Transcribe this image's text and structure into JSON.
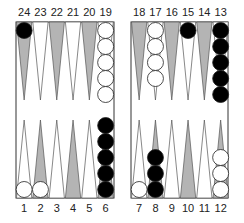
{
  "game": "backgammon",
  "colors": {
    "board_bg": "#ffffff",
    "border": "#333333",
    "triangle_dark": "#b4b4b4",
    "triangle_light": "#ffffff",
    "triangle_stroke": "#555555",
    "checker_black": "#000000",
    "checker_white": "#ffffff"
  },
  "top_labels": [
    "24",
    "23",
    "22",
    "21",
    "20",
    "19",
    "18",
    "17",
    "16",
    "15",
    "14",
    "13"
  ],
  "bottom_labels": [
    "1",
    "2",
    "3",
    "4",
    "5",
    "6",
    "7",
    "8",
    "9",
    "10",
    "11",
    "12"
  ],
  "points": [
    {
      "point": 1,
      "color": "white",
      "count": 1
    },
    {
      "point": 2,
      "color": "white",
      "count": 1
    },
    {
      "point": 3,
      "color": null,
      "count": 0
    },
    {
      "point": 4,
      "color": null,
      "count": 0
    },
    {
      "point": 5,
      "color": null,
      "count": 0
    },
    {
      "point": 6,
      "color": "black",
      "count": 5
    },
    {
      "point": 7,
      "color": "white",
      "count": 1
    },
    {
      "point": 8,
      "color": "black",
      "count": 3
    },
    {
      "point": 9,
      "color": null,
      "count": 0
    },
    {
      "point": 10,
      "color": null,
      "count": 0
    },
    {
      "point": 11,
      "color": null,
      "count": 0
    },
    {
      "point": 12,
      "color": "white",
      "count": 3
    },
    {
      "point": 13,
      "color": "black",
      "count": 5
    },
    {
      "point": 14,
      "color": null,
      "count": 0
    },
    {
      "point": 15,
      "color": "black",
      "count": 1
    },
    {
      "point": 16,
      "color": null,
      "count": 0
    },
    {
      "point": 17,
      "color": "white",
      "count": 4
    },
    {
      "point": 18,
      "color": null,
      "count": 0
    },
    {
      "point": 19,
      "color": "white",
      "count": 5
    },
    {
      "point": 20,
      "color": null,
      "count": 0
    },
    {
      "point": 21,
      "color": null,
      "count": 0
    },
    {
      "point": 22,
      "color": null,
      "count": 0
    },
    {
      "point": 23,
      "color": null,
      "count": 0
    },
    {
      "point": 24,
      "color": "black",
      "count": 1
    }
  ]
}
